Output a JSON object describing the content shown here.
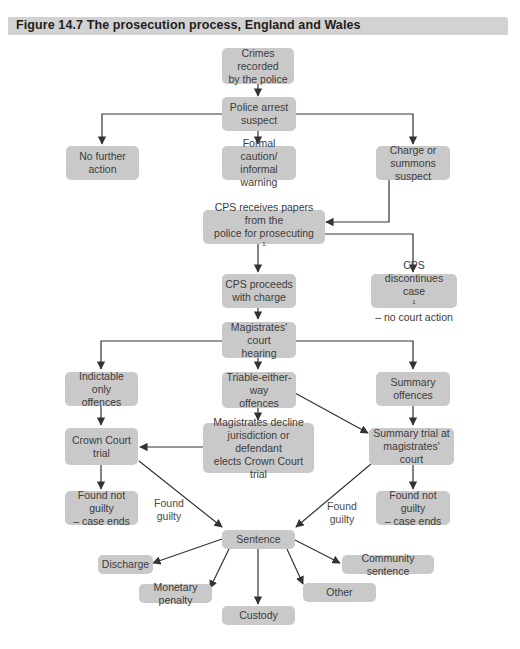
{
  "figure": {
    "title": "Figure 14.7  The prosecution process, England and Wales"
  },
  "nodes": {
    "crimes_recorded": {
      "line1": "Crimes recorded",
      "line2": "by the police"
    },
    "police_arrest": {
      "line1": "Police arrest",
      "line2": "suspect"
    },
    "no_further_action": {
      "line1": "No further action"
    },
    "formal_caution": {
      "line1": "Formal caution/",
      "line2": "informal warning"
    },
    "charge_summons": {
      "line1": "Charge or",
      "line2": "summons suspect"
    },
    "cps_receives": {
      "line1": "CPS receives papers from the",
      "line2": "police for prosecuting",
      "note": "1"
    },
    "cps_proceeds": {
      "line1": "CPS proceeds",
      "line2": "with charge"
    },
    "cps_discontinues": {
      "line1": "CPS discontinues case",
      "line2": "– no court action",
      "note": "1"
    },
    "magistrates_hearing": {
      "line1": "Magistrates' court",
      "line2": "hearing"
    },
    "indictable_only": {
      "line1": "Indictable only",
      "line2": "offences"
    },
    "triable_either_way": {
      "line1": "Triable-either-way",
      "line2": "offences"
    },
    "summary_offences": {
      "line1": "Summary",
      "line2": "offences"
    },
    "crown_court_trial": {
      "line1": "Crown Court",
      "line2": "trial"
    },
    "magistrates_decline": {
      "line1": "Magistrates decline",
      "line2": "jurisdiction or defendant",
      "line3": "elects Crown Court trial"
    },
    "summary_trial": {
      "line1": "Summary trial at",
      "line2": "magistrates' court"
    },
    "not_guilty_left": {
      "line1": "Found not guilty",
      "line2": "– case ends"
    },
    "not_guilty_right": {
      "line1": "Found not guilty",
      "line2": "– case ends"
    },
    "sentence": {
      "line1": "Sentence"
    },
    "discharge": {
      "line1": "Discharge"
    },
    "community_sentence": {
      "line1": "Community sentence"
    },
    "monetary_penalty": {
      "line1": "Monetary penalty"
    },
    "other": {
      "line1": "Other"
    },
    "custody": {
      "line1": "Custody"
    }
  },
  "edge_labels": {
    "found_guilty_left": {
      "line1": "Found",
      "line2": "guilty"
    },
    "found_guilty_right": {
      "line1": "Found",
      "line2": "guilty"
    }
  },
  "colors": {
    "node_fill": "#c9c9c9",
    "title_bar": "#d2d2d2",
    "edge": "#333333"
  }
}
